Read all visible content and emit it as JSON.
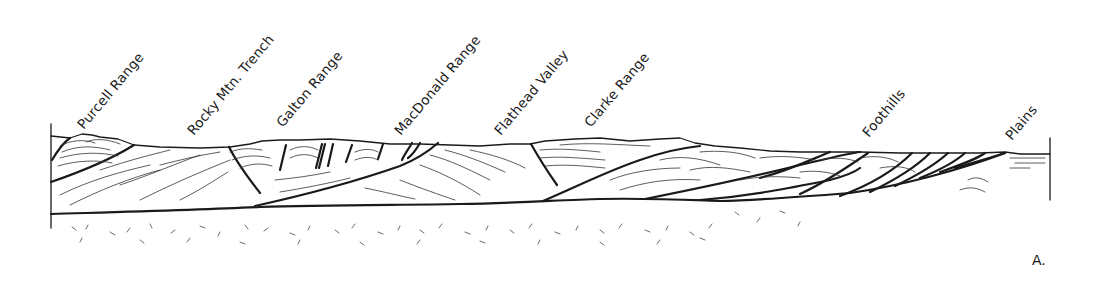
{
  "figure": {
    "panel_label": "A.",
    "type": "geological cross-section",
    "labels": [
      {
        "id": "purcell-range",
        "text": "Purcell Range",
        "x": 86,
        "y": 134
      },
      {
        "id": "rocky-mtn-trench",
        "text": "Rocky Mtn. Trench",
        "x": 196,
        "y": 140
      },
      {
        "id": "galton-range",
        "text": "Galton Range",
        "x": 285,
        "y": 132
      },
      {
        "id": "macdonald-range",
        "text": "MacDonald Range",
        "x": 403,
        "y": 140
      },
      {
        "id": "flathead-valley",
        "text": "Flathead Valley",
        "x": 503,
        "y": 140
      },
      {
        "id": "clarke-range",
        "text": "Clarke Range",
        "x": 593,
        "y": 132
      },
      {
        "id": "foothills",
        "text": "Foothills",
        "x": 871,
        "y": 142
      },
      {
        "id": "plains",
        "text": "Plains",
        "x": 1014,
        "y": 145
      }
    ]
  }
}
